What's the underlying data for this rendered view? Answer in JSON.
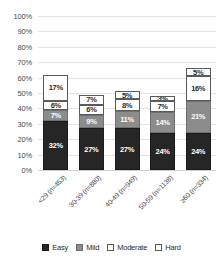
{
  "chart_data": {
    "type": "bar",
    "subtype": "stacked-bar",
    "title": "",
    "xlabel": "",
    "ylabel": "",
    "ylim": [
      0,
      100
    ],
    "ytick_labels": [
      "100%",
      "90%",
      "80%",
      "70%",
      "60%",
      "50%",
      "40%",
      "30%",
      "20%",
      "10%",
      "0%"
    ],
    "ytick_values": [
      100,
      90,
      80,
      70,
      60,
      50,
      40,
      30,
      20,
      10,
      0
    ],
    "grid": true,
    "legend_position": "bottom",
    "value_label_suffix": "%",
    "categories": [
      "<29 (n=453)",
      "30-39 (n=880)",
      "40-49 (n=949)",
      "50-59 (n=1138)",
      "≥60 (n=334)"
    ],
    "series": [
      {
        "name": "Easy",
        "color": "#262626",
        "values": [
          32,
          27,
          27,
          24,
          24
        ],
        "labels": [
          "32%",
          "27%",
          "27%",
          "24%",
          "24%"
        ]
      },
      {
        "name": "Mild",
        "color": "#8c8c8c",
        "values": [
          7,
          9,
          11,
          14,
          21
        ],
        "labels": [
          "7%",
          "9%",
          "11%",
          "14%",
          "21%"
        ]
      },
      {
        "name": "Moderate",
        "color": "#ffffff",
        "values": [
          6,
          6,
          8,
          7,
          16
        ],
        "labels": [
          "6%",
          "6%",
          "8%",
          "7%",
          "16%"
        ]
      },
      {
        "name": "Hard",
        "color": "#ffffff",
        "values": [
          17,
          7,
          5,
          3,
          5
        ],
        "labels": [
          "17%",
          "7%",
          "5%",
          "3%",
          "5%"
        ]
      }
    ]
  }
}
